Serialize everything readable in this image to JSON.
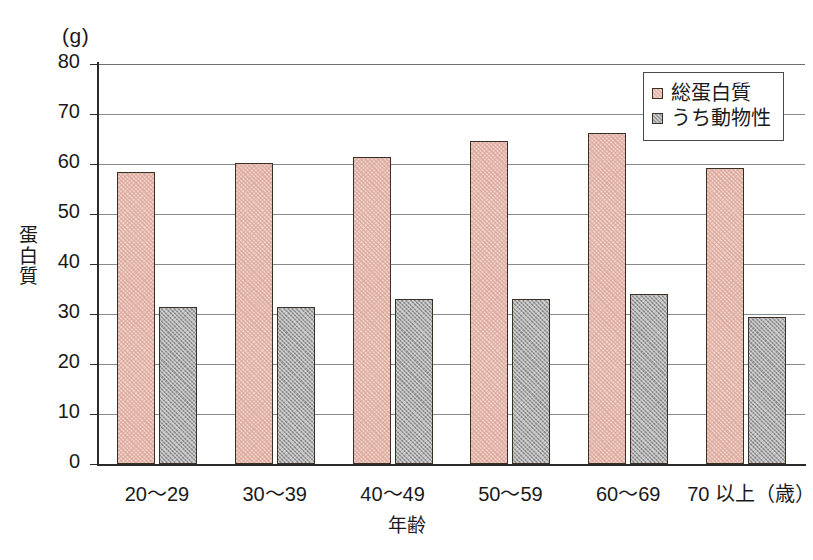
{
  "chart_data": {
    "type": "bar",
    "title": "",
    "unit_label": "(g)",
    "xlabel": "年齢",
    "ylabel": "蛋白質",
    "ylim": [
      0,
      80
    ],
    "ytick_step": 10,
    "yticks": [
      "0",
      "10",
      "20",
      "30",
      "40",
      "50",
      "60",
      "70",
      "80"
    ],
    "grid": true,
    "legend_position": "top-right",
    "categories": [
      "20～29",
      "30～39",
      "40～49",
      "50～59",
      "60～69",
      "70 以上（歳）"
    ],
    "series": [
      {
        "name": "総蛋白質",
        "color": "#efcfc6",
        "values": [
          58.4,
          60.3,
          61.5,
          64.6,
          66.3,
          59.3
        ]
      },
      {
        "name": "うち動物性",
        "color": "#a9a9a9",
        "values": [
          31.5,
          31.4,
          33.1,
          33.1,
          34.0,
          29.4
        ]
      }
    ]
  },
  "legend": {
    "entries": [
      {
        "label": "総蛋白質",
        "swatch": "total-protein-swatch"
      },
      {
        "label": "うち動物性",
        "swatch": "animal-protein-swatch"
      }
    ]
  }
}
